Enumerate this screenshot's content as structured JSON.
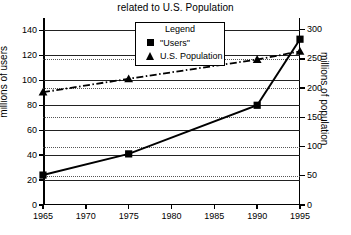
{
  "chart_data": {
    "type": "line",
    "title": "related to U.S. Population",
    "xlabel": "",
    "ylabel": "millions of users",
    "y2label": "millions of population",
    "x": [
      1965,
      1975,
      1990,
      1995
    ],
    "xlim": [
      1965,
      1995
    ],
    "xticks": [
      "1965",
      "1970",
      "1975",
      "1980",
      "1985",
      "1990",
      "1995"
    ],
    "xtick_values": [
      1965,
      1970,
      1975,
      1980,
      1985,
      1990,
      1995
    ],
    "ylim": [
      0,
      150
    ],
    "yticks": [
      "0",
      "20",
      "40",
      "60",
      "80",
      "100",
      "120",
      "140"
    ],
    "ytick_values": [
      0,
      20,
      40,
      60,
      80,
      100,
      120,
      140
    ],
    "y2lim": [
      0,
      320
    ],
    "y2ticks": [
      "0",
      "50",
      "100",
      "150",
      "200",
      "250",
      "300"
    ],
    "y2tick_values": [
      0,
      50,
      100,
      150,
      200,
      250,
      300
    ],
    "grid": "horizontal solid for left axis, horizontal dotted for right axis",
    "legend_position": "top-center inside plot",
    "legend_title": "Legend",
    "series": [
      {
        "name": "\"Users\"",
        "axis": "left",
        "marker": "square",
        "linestyle": "solid",
        "x": [
          1965,
          1975,
          1990,
          1995
        ],
        "values": [
          24,
          41,
          80,
          133
        ]
      },
      {
        "name": "U.S. Population",
        "axis": "right",
        "marker": "triangle",
        "linestyle": "dash-dot",
        "x": [
          1965,
          1975,
          1990,
          1995
        ],
        "values": [
          193,
          216,
          249,
          263
        ]
      }
    ]
  },
  "colors": {
    "foreground": "#000000",
    "background": "#ffffff",
    "grid_solid": "#222222",
    "grid_dotted": "#555555"
  }
}
